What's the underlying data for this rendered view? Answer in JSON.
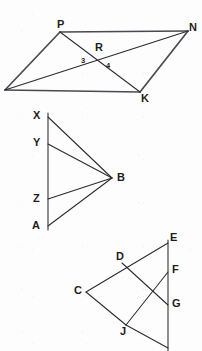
{
  "page": {
    "background_color": "#fdfdfe",
    "ink_color": "#2b2b2f",
    "width": 202,
    "height": 351
  },
  "figures": [
    {
      "id": "figure-parallelogram-pnkr",
      "name": "parallelogram-with-diagonals",
      "labels": {
        "p": "P",
        "n": "N",
        "k": "K",
        "r": "R",
        "angle3": "3",
        "angle4": "4"
      },
      "vertices": [
        {
          "name": "left-unlabeled",
          "label": "",
          "x": 5,
          "y": 90
        },
        {
          "name": "P",
          "label": "P",
          "x": 60,
          "y": 32
        },
        {
          "name": "N",
          "label": "N",
          "x": 188,
          "y": 31
        },
        {
          "name": "K",
          "label": "K",
          "x": 140,
          "y": 92
        },
        {
          "name": "R",
          "label": "R",
          "x": 100,
          "y": 53
        }
      ],
      "segments": [
        {
          "from": "left-unlabeled",
          "to": "P"
        },
        {
          "from": "P",
          "to": "N"
        },
        {
          "from": "left-unlabeled",
          "to": "K"
        },
        {
          "from": "K",
          "to": "N"
        },
        {
          "from": "left-unlabeled",
          "to": "N"
        },
        {
          "from": "P",
          "to": "K"
        }
      ]
    },
    {
      "id": "figure-fan-xyzab",
      "name": "vertical-segment-fan-to-B",
      "labels": {
        "x": "X",
        "y": "Y",
        "z": "Z",
        "a": "A",
        "b": "B"
      },
      "vertices": [
        {
          "name": "X",
          "label": "X",
          "x": 48,
          "y": 117
        },
        {
          "name": "Y",
          "label": "Y",
          "x": 48,
          "y": 144
        },
        {
          "name": "Z",
          "label": "Z",
          "x": 48,
          "y": 199
        },
        {
          "name": "A",
          "label": "A",
          "x": 48,
          "y": 226
        },
        {
          "name": "B",
          "label": "B",
          "x": 112,
          "y": 178
        }
      ],
      "segments": [
        {
          "from": "X",
          "to": "A"
        },
        {
          "from": "X",
          "to": "B"
        },
        {
          "from": "Y",
          "to": "B"
        },
        {
          "from": "Z",
          "to": "B"
        },
        {
          "from": "A",
          "to": "B"
        }
      ]
    },
    {
      "id": "figure-triangle-cdefgj",
      "name": "triangle-with-crossing-cevians",
      "labels": {
        "c": "C",
        "d": "D",
        "e": "E",
        "f": "F",
        "g": "G",
        "j": "J"
      },
      "vertices": [
        {
          "name": "E",
          "label": "E",
          "x": 168,
          "y": 243
        },
        {
          "name": "D",
          "label": "D",
          "x": 122,
          "y": 263
        },
        {
          "name": "F",
          "label": "F",
          "x": 168,
          "y": 272
        },
        {
          "name": "C",
          "label": "C",
          "x": 86,
          "y": 292
        },
        {
          "name": "G",
          "label": "G",
          "x": 168,
          "y": 305
        },
        {
          "name": "J",
          "label": "J",
          "x": 126,
          "y": 325
        },
        {
          "name": "H-clipped",
          "label": "",
          "x": 168,
          "y": 345
        }
      ],
      "segments": [
        {
          "from": "E",
          "to": "C"
        },
        {
          "from": "C",
          "to": "J"
        },
        {
          "from": "E",
          "to": "H-clipped"
        },
        {
          "from": "D",
          "to": "G"
        },
        {
          "from": "J",
          "to": "F"
        },
        {
          "from": "J",
          "to": "H-clipped"
        }
      ]
    }
  ]
}
